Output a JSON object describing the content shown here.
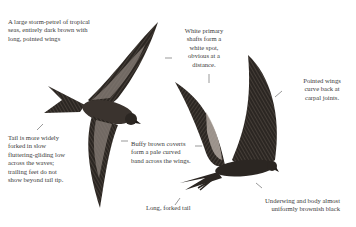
{
  "illustration": {
    "subject": "storm-petrel in flight (two birds)",
    "colors": {
      "plumage_dark": "#2b2622",
      "covert_band": "#8a8079",
      "background": "#ffffff",
      "text": "#3a3a3a"
    }
  },
  "annotations": [
    {
      "id": "intro",
      "text": "A large storm-petrel of tropical\nseas, entirely dark brown with\nlong, pointed wings"
    },
    {
      "id": "primary-shafts",
      "text": "White primary\nshafts form a\nwhite spot,\nobvious at a\ndistance."
    },
    {
      "id": "pointed-wings",
      "text": "Pointed wings\ncurve back at\ncarpal joints."
    },
    {
      "id": "tail-forked",
      "text": "Tail is more widely\nforked in slow\nfluttering-gliding low\nacross the waves;\ntrailing feet do not\nshow beyond tail tip."
    },
    {
      "id": "buffy-coverts",
      "text": "Buffy brown coverts\nform a pale curved\nband across the wings."
    },
    {
      "id": "long-tail",
      "text": "Long, forked tail"
    },
    {
      "id": "underwing",
      "text": "Underwing and body almost\nuniformly brownish black"
    }
  ]
}
